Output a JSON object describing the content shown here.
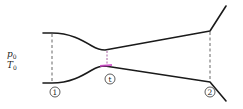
{
  "figure": {
    "type": "converging-diverging nozzle schematic",
    "inlet_conditions": {
      "pressure": {
        "symbol": "p",
        "subscript": "0"
      },
      "temperature": {
        "symbol": "T",
        "subscript": "0"
      }
    },
    "stations": [
      {
        "id": "station-1",
        "label": "1",
        "description": "inlet"
      },
      {
        "id": "station-t",
        "label": "t",
        "description": "throat"
      },
      {
        "id": "station-2",
        "label": "2",
        "description": "exit"
      }
    ],
    "colors": {
      "wall": "#1a1a1a",
      "dashed": "#555555",
      "throat_highlight": "#d040c8"
    }
  }
}
